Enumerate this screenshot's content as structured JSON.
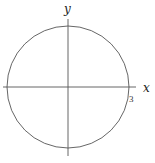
{
  "diagram": {
    "type": "circle-on-axes",
    "x_axis_label": "x",
    "y_axis_label": "y",
    "radius_label": "3",
    "colors": {
      "stroke": "#555555",
      "background": "#ffffff",
      "text": "#222222"
    }
  }
}
